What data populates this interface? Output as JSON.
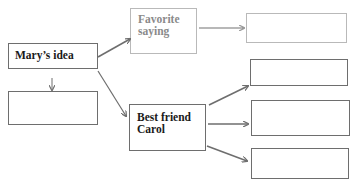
{
  "diagram": {
    "nodes": [
      {
        "id": "marys-idea",
        "label": "Mary’s idea"
      },
      {
        "id": "below-idea",
        "label": ""
      },
      {
        "id": "favorite-saying",
        "label": "Favorite saying",
        "lines": [
          "Favorite",
          "saying"
        ]
      },
      {
        "id": "saying-detail",
        "label": ""
      },
      {
        "id": "best-friend",
        "label": "Best friend Carol",
        "lines": [
          "Best friend",
          "Carol"
        ]
      },
      {
        "id": "friend-detail-1",
        "label": ""
      },
      {
        "id": "friend-detail-2",
        "label": ""
      },
      {
        "id": "friend-detail-3",
        "label": ""
      }
    ],
    "edges": [
      {
        "from": "marys-idea",
        "to": "favorite-saying"
      },
      {
        "from": "marys-idea",
        "to": "best-friend"
      },
      {
        "from": "marys-idea",
        "to": "below-idea"
      },
      {
        "from": "favorite-saying",
        "to": "saying-detail"
      },
      {
        "from": "best-friend",
        "to": "friend-detail-1"
      },
      {
        "from": "best-friend",
        "to": "friend-detail-2"
      },
      {
        "from": "best-friend",
        "to": "friend-detail-3"
      }
    ],
    "colors": {
      "border": "#6e6e6e",
      "light_border": "#b9b9b9",
      "text": "#1a1a1a",
      "gray_text": "#8a8a8a"
    }
  }
}
